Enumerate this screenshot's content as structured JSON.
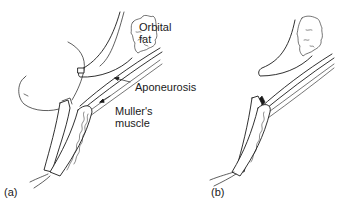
{
  "figure": {
    "panels": [
      {
        "id": "a",
        "label": "(a)",
        "annotations": {
          "orbital_fat_line1": "Orbital",
          "orbital_fat_line2": "fat",
          "aponeurosis": "Aponeurosis",
          "muller_line1": "Muller's",
          "muller_line2": "muscle"
        }
      },
      {
        "id": "b",
        "label": "(b)"
      }
    ],
    "colors": {
      "line": "#1a1a1a",
      "background": "#ffffff"
    }
  }
}
